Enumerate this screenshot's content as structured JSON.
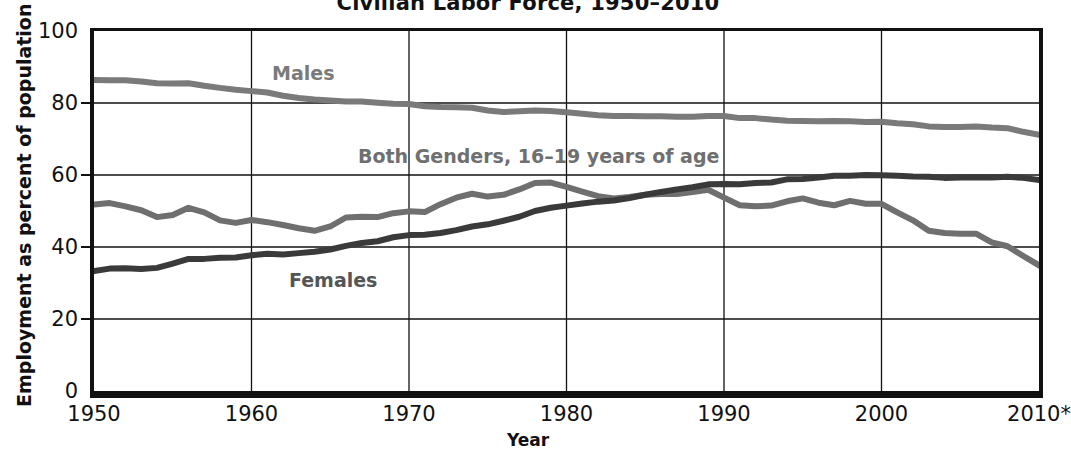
{
  "chart_data": {
    "type": "line",
    "title": "Civilian Labor Force, 1950–2010",
    "xlabel": "Year",
    "ylabel": "Employment as percent of population",
    "xlim": [
      1950,
      2010
    ],
    "ylim": [
      0,
      100
    ],
    "ytick_labels": [
      "0",
      "20",
      "40",
      "60",
      "80",
      "100"
    ],
    "ytick_values": [
      0,
      20,
      40,
      60,
      80,
      100
    ],
    "xtick_labels": [
      "1950",
      "1960",
      "1970",
      "1980",
      "1990",
      "2000",
      "2010*"
    ],
    "xtick_values": [
      1950,
      1960,
      1970,
      1980,
      1990,
      2000,
      2010
    ],
    "grid": true,
    "legend_position": "in-plot annotations",
    "footnote_marker": "*",
    "series": [
      {
        "name": "Males",
        "label": "Males",
        "color": "#7a7a7a",
        "x": [
          1950,
          1951,
          1952,
          1953,
          1954,
          1955,
          1956,
          1957,
          1958,
          1959,
          1960,
          1961,
          1962,
          1963,
          1964,
          1965,
          1966,
          1967,
          1968,
          1969,
          1970,
          1971,
          1972,
          1973,
          1974,
          1975,
          1976,
          1977,
          1978,
          1979,
          1980,
          1981,
          1982,
          1983,
          1984,
          1985,
          1986,
          1987,
          1988,
          1989,
          1990,
          1991,
          1992,
          1993,
          1994,
          1995,
          1996,
          1997,
          1998,
          1999,
          2000,
          2001,
          2002,
          2003,
          2004,
          2005,
          2006,
          2007,
          2008,
          2009,
          2010
        ],
        "values": [
          86.4,
          86.3,
          86.3,
          86.0,
          85.5,
          85.4,
          85.5,
          84.8,
          84.2,
          83.7,
          83.3,
          82.9,
          82.0,
          81.4,
          81.0,
          80.7,
          80.4,
          80.4,
          80.1,
          79.8,
          79.7,
          79.1,
          78.9,
          78.8,
          78.7,
          77.9,
          77.5,
          77.7,
          77.9,
          77.8,
          77.4,
          77.0,
          76.6,
          76.4,
          76.4,
          76.3,
          76.3,
          76.2,
          76.2,
          76.4,
          76.4,
          75.8,
          75.8,
          75.4,
          75.1,
          75.0,
          74.9,
          75.0,
          74.9,
          74.7,
          74.8,
          74.4,
          74.1,
          73.5,
          73.3,
          73.3,
          73.5,
          73.2,
          73.0,
          72.0,
          71.2
        ]
      },
      {
        "name": "Both Genders, 16–19 years of age",
        "label": "Both Genders, 16–19 years of age",
        "color": "#6f6f6f",
        "x": [
          1950,
          1951,
          1952,
          1953,
          1954,
          1955,
          1956,
          1957,
          1958,
          1959,
          1960,
          1961,
          1962,
          1963,
          1964,
          1965,
          1966,
          1967,
          1968,
          1969,
          1970,
          1971,
          1972,
          1973,
          1974,
          1975,
          1976,
          1977,
          1978,
          1979,
          1980,
          1981,
          1982,
          1983,
          1984,
          1985,
          1986,
          1987,
          1988,
          1989,
          1990,
          1991,
          1992,
          1993,
          1994,
          1995,
          1996,
          1997,
          1998,
          1999,
          2000,
          2001,
          2002,
          2003,
          2004,
          2005,
          2006,
          2007,
          2008,
          2009,
          2010
        ],
        "values": [
          51.8,
          52.2,
          51.3,
          50.2,
          48.3,
          48.9,
          50.9,
          49.6,
          47.4,
          46.7,
          47.5,
          46.9,
          46.1,
          45.2,
          44.5,
          45.7,
          48.2,
          48.4,
          48.3,
          49.4,
          49.9,
          49.7,
          51.9,
          53.7,
          54.8,
          54.0,
          54.5,
          56.0,
          57.8,
          57.9,
          56.7,
          55.4,
          54.1,
          53.5,
          53.9,
          54.5,
          54.7,
          54.7,
          55.3,
          55.9,
          53.7,
          51.6,
          51.3,
          51.5,
          52.7,
          53.5,
          52.3,
          51.6,
          52.8,
          52.0,
          52.0,
          49.6,
          47.4,
          44.5,
          43.9,
          43.7,
          43.7,
          41.3,
          40.2,
          37.5,
          34.9
        ]
      },
      {
        "name": "Females",
        "label": "Females",
        "color": "#3a3a3a",
        "x": [
          1950,
          1951,
          1952,
          1953,
          1954,
          1955,
          1956,
          1957,
          1958,
          1959,
          1960,
          1961,
          1962,
          1963,
          1964,
          1965,
          1966,
          1967,
          1968,
          1969,
          1970,
          1971,
          1972,
          1973,
          1974,
          1975,
          1976,
          1977,
          1978,
          1979,
          1980,
          1981,
          1982,
          1983,
          1984,
          1985,
          1986,
          1987,
          1988,
          1989,
          1990,
          1991,
          1992,
          1993,
          1994,
          1995,
          1996,
          1997,
          1998,
          1999,
          2000,
          2001,
          2002,
          2003,
          2004,
          2005,
          2006,
          2007,
          2008,
          2009,
          2010
        ],
        "values": [
          33.3,
          34.0,
          34.1,
          33.9,
          34.2,
          35.4,
          36.7,
          36.7,
          37.0,
          37.1,
          37.7,
          38.1,
          37.9,
          38.3,
          38.7,
          39.3,
          40.3,
          41.1,
          41.6,
          42.7,
          43.3,
          43.4,
          43.9,
          44.7,
          45.7,
          46.3,
          47.3,
          48.4,
          50.0,
          50.9,
          51.5,
          52.1,
          52.6,
          52.9,
          53.6,
          54.5,
          55.3,
          56.0,
          56.6,
          57.4,
          57.5,
          57.4,
          57.8,
          57.9,
          58.8,
          58.9,
          59.3,
          59.8,
          59.8,
          60.0,
          59.9,
          59.8,
          59.6,
          59.5,
          59.2,
          59.3,
          59.4,
          59.3,
          59.5,
          59.2,
          58.6
        ]
      }
    ]
  },
  "series_labels": {
    "males": "Males",
    "both": "Both Genders, 16–19 years of age",
    "females": "Females"
  },
  "axes": {
    "title": "Civilian Labor Force, 1950–2010",
    "x_title": "Year",
    "y_title": "Employment as percent of population"
  }
}
